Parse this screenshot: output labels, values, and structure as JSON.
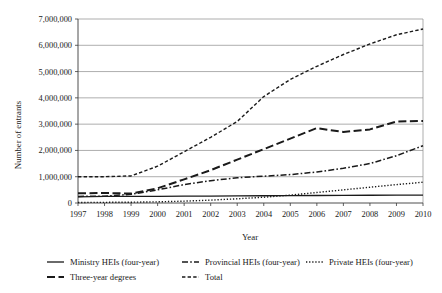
{
  "chart_data": {
    "type": "line",
    "title": "",
    "xlabel": "Year",
    "ylabel": "Number of entrants",
    "x": [
      1997,
      1998,
      1999,
      2000,
      2001,
      2002,
      2003,
      2004,
      2005,
      2006,
      2007,
      2008,
      2009,
      2010
    ],
    "xtick_labels": [
      "1997",
      "1998",
      "1999",
      "2000",
      "2001",
      "2002",
      "2003",
      "2004",
      "2005",
      "2006",
      "2007",
      "2008",
      "2009",
      "2010"
    ],
    "ytick_labels": [
      "0",
      "1,000,000",
      "2,000,000",
      "3,000,000",
      "4,000,000",
      "5,000,000",
      "6,000,000",
      "7,000,000"
    ],
    "ytick_values": [
      0,
      1000000,
      2000000,
      3000000,
      4000000,
      5000000,
      6000000,
      7000000
    ],
    "xlim": [
      1997,
      2010
    ],
    "ylim": [
      0,
      7000000
    ],
    "grid": true,
    "legend_position": "below",
    "series": [
      {
        "name": "Ministry HEIs (four-year)",
        "style": "solid",
        "color": "#1a1a1a",
        "values": [
          230000,
          250000,
          250000,
          255000,
          260000,
          265000,
          270000,
          275000,
          280000,
          285000,
          290000,
          295000,
          300000,
          300000
        ]
      },
      {
        "name": "Provincial HEIs (four-year)",
        "style": "dash-dot",
        "color": "#1a1a1a",
        "values": [
          250000,
          260000,
          330000,
          500000,
          700000,
          850000,
          960000,
          1020000,
          1080000,
          1180000,
          1320000,
          1500000,
          1800000,
          2180000
        ]
      },
      {
        "name": "Private HEIs (four-year)",
        "style": "dotted",
        "color": "#1a1a1a",
        "values": [
          20000,
          25000,
          30000,
          45000,
          70000,
          110000,
          160000,
          220000,
          300000,
          400000,
          500000,
          600000,
          700000,
          790000
        ]
      },
      {
        "name": "Three-year degrees",
        "style": "long-dash",
        "color": "#1a1a1a",
        "values": [
          370000,
          380000,
          360000,
          560000,
          900000,
          1250000,
          1650000,
          2050000,
          2450000,
          2850000,
          2700000,
          2800000,
          3100000,
          3120000
        ]
      },
      {
        "name": "Total",
        "style": "short-dash",
        "color": "#1a1a1a",
        "values": [
          1000000,
          1000000,
          1030000,
          1400000,
          1950000,
          2500000,
          3100000,
          4050000,
          4700000,
          5200000,
          5650000,
          6050000,
          6400000,
          6620000
        ]
      }
    ]
  },
  "legend": {
    "entries": [
      {
        "label": "Ministry HEIs (four-year)",
        "style": "solid"
      },
      {
        "label": "Provincial HEIs (four-year)",
        "style": "dash-dot"
      },
      {
        "label": "Private HEIs (four-year)",
        "style": "dotted"
      },
      {
        "label": "Three-year degrees",
        "style": "long-dash"
      },
      {
        "label": "Total",
        "style": "short-dash"
      }
    ]
  }
}
